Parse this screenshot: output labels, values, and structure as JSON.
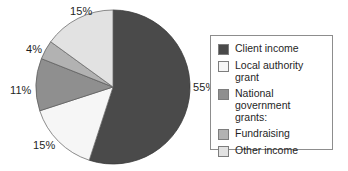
{
  "chart_data": {
    "type": "pie",
    "title": "",
    "subtitle": "",
    "xlabel": "",
    "ylabel": "",
    "grid": false,
    "legend_position": "right",
    "start_angle_deg": 0,
    "direction": "clockwise",
    "categories": [
      "Client income",
      "Local authority grant",
      "National government grants:",
      "Fundraising",
      "Other income"
    ],
    "values": [
      55,
      15,
      11,
      4,
      15
    ],
    "value_unit": "%",
    "colors": [
      "#4a4a4a",
      "#f6f6f6",
      "#8f8f8f",
      "#b2b2b2",
      "#e2e2e2"
    ],
    "slices": [
      {
        "label": "Client income",
        "value": 55,
        "display": "55%",
        "color": "#4a4a4a"
      },
      {
        "label": "Local authority grant",
        "value": 15,
        "display": "15%",
        "color": "#f6f6f6"
      },
      {
        "label": "National government grants:",
        "value": 11,
        "display": "11%",
        "color": "#8f8f8f"
      },
      {
        "label": "Fundraising",
        "value": 4,
        "display": "4%",
        "color": "#b2b2b2"
      },
      {
        "label": "Other income",
        "value": 15,
        "display": "15%",
        "color": "#e2e2e2"
      }
    ]
  },
  "pie": {
    "labels": {
      "client_income": "55%",
      "local_authority_grant": "15%",
      "national_government_grants": "11%",
      "fundraising": "4%",
      "other_income": "15%"
    }
  },
  "legend": {
    "items": [
      {
        "label": "Client income",
        "color": "#4a4a4a"
      },
      {
        "label": "Local authority grant",
        "color": "#f6f6f6"
      },
      {
        "label": "National government\ngrants:",
        "color": "#8f8f8f"
      },
      {
        "label": "Fundraising",
        "color": "#b2b2b2"
      },
      {
        "label": "Other income",
        "color": "#e2e2e2"
      }
    ]
  }
}
